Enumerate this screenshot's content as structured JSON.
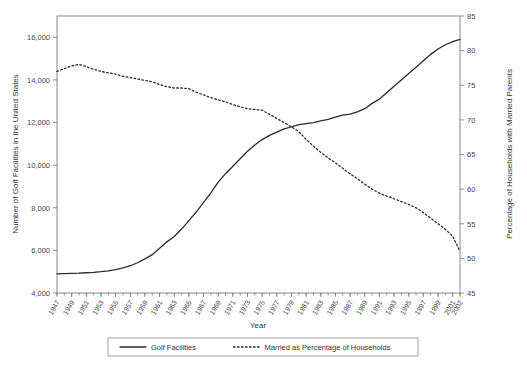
{
  "chart_data": {
    "type": "line",
    "title": "",
    "xlabel": "Year",
    "ylabel": "Number of Golf Facilities in the United States",
    "y2label": "Percentage of Households with Married Parents",
    "xlim": [
      1947,
      2002
    ],
    "ylim": [
      4000,
      17000
    ],
    "y2lim": [
      45,
      85
    ],
    "grid": false,
    "legend_position": "bottom-center",
    "y_ticklabels": [
      "4,000",
      "6,000",
      "8,000",
      "10,000",
      "12,000",
      "14,000",
      "16,000"
    ],
    "y_tickvalues": [
      4000,
      6000,
      8000,
      10000,
      12000,
      14000,
      16000
    ],
    "y2_ticklabels": [
      "45",
      "50",
      "55",
      "60",
      "65",
      "70",
      "75",
      "80",
      "85"
    ],
    "y2_tickvalues": [
      45,
      50,
      55,
      60,
      65,
      70,
      75,
      80,
      85
    ],
    "x_ticklabels": [
      "1947",
      "1949",
      "1951",
      "1953",
      "1955",
      "1957",
      "1959",
      "1961",
      "1963",
      "1965",
      "1967",
      "1969",
      "1971",
      "1973",
      "1975",
      "1977",
      "1979",
      "1981",
      "1983",
      "1985",
      "1987",
      "1989",
      "1991",
      "1993",
      "1995",
      "1997",
      "1999",
      "2001",
      "2002"
    ],
    "x": [
      1947,
      1948,
      1949,
      1950,
      1951,
      1952,
      1953,
      1954,
      1955,
      1956,
      1957,
      1958,
      1959,
      1960,
      1961,
      1962,
      1963,
      1964,
      1965,
      1966,
      1967,
      1968,
      1969,
      1970,
      1971,
      1972,
      1973,
      1974,
      1975,
      1976,
      1977,
      1978,
      1979,
      1980,
      1981,
      1982,
      1983,
      1984,
      1985,
      1986,
      1987,
      1988,
      1989,
      1990,
      1991,
      1992,
      1993,
      1994,
      1995,
      1996,
      1997,
      1998,
      1999,
      2000,
      2001,
      2002
    ],
    "series": [
      {
        "name": "Golf Facilities",
        "style": "solid",
        "axis": "left",
        "color": "#2b2b2b",
        "values": [
          4900,
          4910,
          4920,
          4930,
          4950,
          4970,
          5000,
          5040,
          5100,
          5180,
          5280,
          5420,
          5600,
          5800,
          6100,
          6400,
          6650,
          7000,
          7400,
          7800,
          8250,
          8700,
          9200,
          9600,
          9950,
          10300,
          10650,
          10950,
          11200,
          11400,
          11550,
          11700,
          11800,
          11900,
          11950,
          12000,
          12080,
          12150,
          12250,
          12350,
          12400,
          12500,
          12650,
          12900,
          13100,
          13400,
          13700,
          14000,
          14300,
          14600,
          14900,
          15200,
          15450,
          15650,
          15800,
          15900
        ]
      },
      {
        "name": "Married as Percentage of Households",
        "style": "dotted",
        "axis": "right",
        "color": "#2b2b2b",
        "values": [
          77.0,
          77.4,
          77.8,
          78.0,
          77.7,
          77.3,
          77.0,
          76.8,
          76.6,
          76.3,
          76.1,
          75.9,
          75.7,
          75.5,
          75.1,
          74.8,
          74.6,
          74.6,
          74.5,
          74.0,
          73.6,
          73.2,
          72.9,
          72.6,
          72.2,
          71.9,
          71.6,
          71.5,
          71.4,
          70.8,
          70.2,
          69.6,
          69.0,
          68.3,
          67.2,
          66.2,
          65.3,
          64.5,
          63.8,
          63.0,
          62.2,
          61.5,
          60.7,
          60.0,
          59.4,
          59.0,
          58.6,
          58.2,
          57.8,
          57.3,
          56.6,
          55.8,
          55.0,
          54.2,
          53.2,
          51.0
        ]
      }
    ],
    "legend": [
      {
        "label": "Golf Facilities",
        "style": "solid"
      },
      {
        "label": "Married as Percentage of Households",
        "style": "dotted"
      }
    ]
  }
}
